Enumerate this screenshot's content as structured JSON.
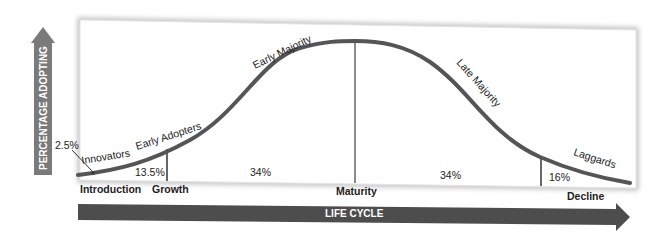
{
  "colors": {
    "curve": "#555555",
    "arrow": "#4d4d4d",
    "vertical_arrow": "#7a7a7a",
    "divider": "#666666",
    "text": "#222222"
  },
  "axes": {
    "y_label": "PERCENTAGE ADOPTING",
    "x_label": "LIFE CYCLE"
  },
  "segments": [
    {
      "name": "Innovators",
      "percent": "2.5%"
    },
    {
      "name": "Early Adopters",
      "percent": "13.5%"
    },
    {
      "name": "Early Majority",
      "percent": "34%"
    },
    {
      "name": "Late Majority",
      "percent": "34%"
    },
    {
      "name": "Laggards",
      "percent": "16%"
    }
  ],
  "stages": [
    "Introduction",
    "Growth",
    "Maturity",
    "Decline"
  ]
}
